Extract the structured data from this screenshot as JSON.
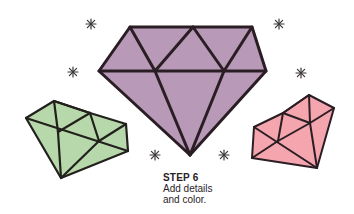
{
  "caption": {
    "step": "STEP 6",
    "line1": "Add details",
    "line2": "and color."
  },
  "colors": {
    "purple_gem": "#b89ab8",
    "green_gem": "#b7d8aa",
    "pink_gem": "#f4a5ae",
    "outline": "#2a1e24",
    "sparkle": "#3a3438",
    "background": "#ffffff"
  },
  "illustration": {
    "gems": [
      {
        "name": "large-purple-diamond",
        "color": "purple"
      },
      {
        "name": "small-green-diamond",
        "color": "green"
      },
      {
        "name": "small-pink-diamond",
        "color": "pink"
      }
    ],
    "sparkles_count": 6
  }
}
